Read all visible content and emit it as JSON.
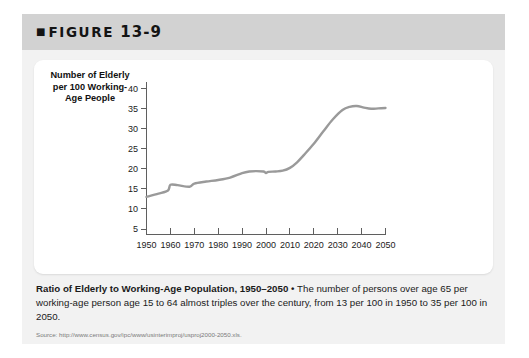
{
  "figure": {
    "bullet": "■",
    "label": "FIGURE",
    "number": "13-9"
  },
  "chart_data": {
    "type": "line",
    "title": "Ratio of Elderly to Working-Age Population, 1950–2050",
    "xlabel": "",
    "ylabel": "Number of Elderly per 100 Working-Age People",
    "xlim": [
      1950,
      2050
    ],
    "ylim": [
      0,
      42
    ],
    "grid": false,
    "legend": null,
    "xticks": [
      "1950",
      "1960",
      "1970",
      "1980",
      "1990",
      "2000",
      "2010",
      "2020",
      "2030",
      "2040",
      "2050"
    ],
    "yticks": [
      "5",
      "10",
      "15",
      "20",
      "25",
      "30",
      "35",
      "40"
    ],
    "line_color": "#9a9a9a",
    "series": [
      {
        "name": "Elderly per 100 working-age people",
        "x": [
          1950,
          1955,
          1959,
          1960,
          1963,
          1968,
          1970,
          1975,
          1980,
          1985,
          1990,
          1993,
          1996,
          1999,
          2000,
          2001,
          2004,
          2007,
          2010,
          2013,
          2016,
          2020,
          2024,
          2028,
          2032,
          2035,
          2038,
          2041,
          2044,
          2047,
          2050
        ],
        "values": [
          13.0,
          13.8,
          14.6,
          16.0,
          15.9,
          15.5,
          16.3,
          16.8,
          17.2,
          17.8,
          18.9,
          19.3,
          19.4,
          19.3,
          18.9,
          19.2,
          19.3,
          19.5,
          20.2,
          21.6,
          23.5,
          26.2,
          29.3,
          32.3,
          34.6,
          35.4,
          35.6,
          35.2,
          34.9,
          35.0,
          35.1
        ]
      }
    ]
  },
  "caption": {
    "lead": "Ratio of Elderly to Working-Age Population, 1950–2050",
    "separator": " • ",
    "body": "The number of persons over age 65 per working-age person age 15 to 64 almost triples over the century, from 13 per 100 in 1950 to 35 per 100 in 2050."
  },
  "source": {
    "text": "Source: http://www.census.gov/ipc/www/usinterimproj/usproj2000-2050.xls."
  }
}
